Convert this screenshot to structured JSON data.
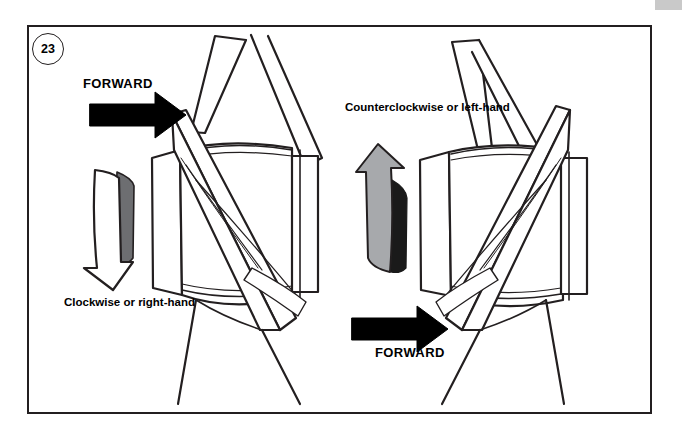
{
  "figure": {
    "number": "23",
    "caption_alt": "Propeller rotation direction diagram"
  },
  "labels": {
    "forward_top": "FORWARD",
    "forward_bottom": "FORWARD",
    "clockwise": "Clockwise or right-hand",
    "counterclockwise": "Counterclockwise or left-hand"
  },
  "colors": {
    "line": "#231f20",
    "arrow_black": "#000000",
    "arrow_gray_dark": "#6d6e71",
    "arrow_gray_light": "#a7a9ac",
    "arrow_shadow": "#1a1a1a",
    "background": "#ffffff",
    "corner_tab": "#c9c9c9"
  },
  "elements": {
    "left_assembly": "right-hand-propeller",
    "right_assembly": "left-hand-propeller",
    "left_rotation_arrow": "downward-curved-arrow",
    "right_rotation_arrow": "upward-curved-arrow",
    "forward_arrow_top": "right-pointing-arrow",
    "forward_arrow_bottom": "right-pointing-arrow"
  }
}
